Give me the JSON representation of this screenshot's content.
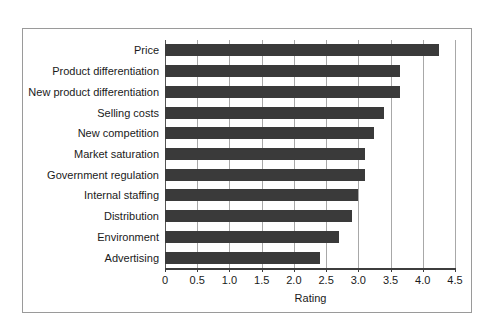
{
  "chart_data": {
    "type": "bar",
    "orientation": "horizontal",
    "title": "",
    "subtitle": "",
    "xlabel": "Rating",
    "ylabel": "",
    "xlim": [
      0,
      4.5
    ],
    "xticks": [
      0,
      0.5,
      1.0,
      1.5,
      2.0,
      2.5,
      3.0,
      3.5,
      4.0,
      4.5
    ],
    "xtick_labels": [
      "0",
      "0.5",
      "1.0",
      "1.5",
      "2.0",
      "2.5",
      "3.0",
      "3.5",
      "4.0",
      "4.5"
    ],
    "grid": "vertical",
    "legend": null,
    "bar_color": "#3a3a3a",
    "categories": [
      "Price",
      "Product differentiation",
      "New product differentiation",
      "Selling costs",
      "New competition",
      "Market saturation",
      "Government regulation",
      "Internal staffing",
      "Distribution",
      "Environment",
      "Advertising"
    ],
    "values": [
      4.25,
      3.65,
      3.65,
      3.4,
      3.25,
      3.1,
      3.1,
      3.0,
      2.9,
      2.7,
      2.4
    ]
  },
  "figure": {
    "frame_color": "#9a9a9a",
    "background": "#ffffff"
  }
}
